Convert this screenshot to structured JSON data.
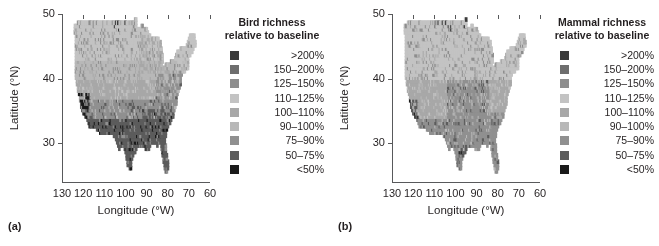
{
  "figure": {
    "background": "#ffffff",
    "axis_color": "#58595b",
    "text_color": "#231f20"
  },
  "chart_data": {
    "type": "heatmap",
    "title": "",
    "xlabel": "Longitude (°W)",
    "ylabel": "Latitude (°N)",
    "xlim": [
      130,
      60
    ],
    "ylim": [
      24,
      50
    ],
    "xticks": [
      130,
      120,
      110,
      100,
      90,
      80,
      70,
      60
    ],
    "yticks": [
      50,
      40,
      30
    ],
    "grid": false,
    "legend_position": "right",
    "cell_size_deg": 0.5,
    "classes": [
      {
        "label": ">200%",
        "color": "#3b3b3b",
        "min": 200,
        "max": null
      },
      {
        "label": "150–200%",
        "color": "#6e6e6e",
        "min": 150,
        "max": 200
      },
      {
        "label": "125–150%",
        "color": "#8e8e8e",
        "min": 125,
        "max": 150
      },
      {
        "label": "110–125%",
        "color": "#c3c3c3",
        "min": 110,
        "max": 125
      },
      {
        "label": "100–110%",
        "color": "#a8a8a8",
        "min": 100,
        "max": 110
      },
      {
        "label": "90–100%",
        "color": "#b8b8b8",
        "min": 90,
        "max": 100
      },
      {
        "label": "75–90%",
        "color": "#909090",
        "min": 75,
        "max": 90
      },
      {
        "label": "50–75%",
        "color": "#5c5c5c",
        "min": 50,
        "max": 75
      },
      {
        "label": "<50%",
        "color": "#1a1a1a",
        "min": null,
        "max": 50
      }
    ],
    "panels": [
      {
        "tag": "(a)",
        "legend_title_line1": "Bird richness",
        "legend_title_line2": "relative to baseline",
        "taxon": "bird",
        "field": {
          "description": "Richness class index by latitude band; north lighter (higher %), south darker (lower %).",
          "lat_bands": [
            {
              "lat_min": 46.0,
              "lat_max": 50.0,
              "class": 3
            },
            {
              "lat_min": 43.0,
              "lat_max": 46.0,
              "class": 3
            },
            {
              "lat_min": 40.0,
              "lat_max": 43.0,
              "class": 5
            },
            {
              "lat_min": 37.0,
              "lat_max": 40.0,
              "class": 4
            },
            {
              "lat_min": 34.0,
              "lat_max": 37.0,
              "class": 6
            },
            {
              "lat_min": 30.0,
              "lat_max": 34.0,
              "class": 7
            },
            {
              "lat_min": 24.0,
              "lat_max": 30.0,
              "class": 7
            }
          ],
          "hotspots": [
            {
              "name": "california-coast-low",
              "lon_min": 124.0,
              "lon_max": 117.0,
              "lat_min": 32.0,
              "lat_max": 38.0,
              "class": 8,
              "density": 0.55
            },
            {
              "name": "sierra-edge-low",
              "lon_min": 122.0,
              "lon_max": 118.0,
              "lat_min": 33.0,
              "lat_max": 36.5,
              "class": 7,
              "density": 0.5
            },
            {
              "name": "northern-plains-dark-specks",
              "lon_min": 106.0,
              "lon_max": 96.0,
              "lat_min": 47.5,
              "lat_max": 49.5,
              "class": 0,
              "density": 0.05
            },
            {
              "name": "gulf-coast-low",
              "lon_min": 98.0,
              "lon_max": 81.0,
              "lat_min": 25.0,
              "lat_max": 31.5,
              "class": 7,
              "density": 0.85
            },
            {
              "name": "southeast-low",
              "lon_min": 92.0,
              "lon_max": 76.0,
              "lat_min": 29.0,
              "lat_max": 35.5,
              "class": 7,
              "density": 0.7
            },
            {
              "name": "appalachian-mid",
              "lon_min": 86.0,
              "lon_max": 74.0,
              "lat_min": 35.0,
              "lat_max": 41.0,
              "class": 6,
              "density": 0.6
            },
            {
              "name": "northeast-light",
              "lon_min": 76.0,
              "lon_max": 67.0,
              "lat_min": 41.0,
              "lat_max": 47.5,
              "class": 3,
              "density": 0.8
            },
            {
              "name": "great-lakes-mid",
              "lon_min": 95.0,
              "lon_max": 80.0,
              "lat_min": 41.0,
              "lat_max": 47.0,
              "class": 4,
              "density": 0.5
            }
          ],
          "noise": 0.22
        }
      },
      {
        "tag": "(b)",
        "legend_title_line1": "Mammal richness",
        "legend_title_line2": "relative to baseline",
        "taxon": "mammal",
        "field": {
          "description": "Mammal pattern is lighter overall; most of country near baseline.",
          "lat_bands": [
            {
              "lat_min": 46.0,
              "lat_max": 50.0,
              "class": 3
            },
            {
              "lat_min": 43.0,
              "lat_max": 46.0,
              "class": 3
            },
            {
              "lat_min": 40.0,
              "lat_max": 43.0,
              "class": 3
            },
            {
              "lat_min": 37.0,
              "lat_max": 40.0,
              "class": 4
            },
            {
              "lat_min": 34.0,
              "lat_max": 37.0,
              "class": 4
            },
            {
              "lat_min": 30.0,
              "lat_max": 34.0,
              "class": 6
            },
            {
              "lat_min": 24.0,
              "lat_max": 30.0,
              "class": 6
            }
          ],
          "hotspots": [
            {
              "name": "california-coast-low",
              "lon_min": 124.0,
              "lon_max": 118.0,
              "lat_min": 32.5,
              "lat_max": 37.0,
              "class": 7,
              "density": 0.55
            },
            {
              "name": "socal-darkest",
              "lon_min": 121.0,
              "lon_max": 117.5,
              "lat_min": 32.5,
              "lat_max": 35.0,
              "class": 8,
              "density": 0.25
            },
            {
              "name": "northern-tier-specks",
              "lon_min": 112.0,
              "lon_max": 95.0,
              "lat_min": 47.5,
              "lat_max": 49.5,
              "class": 0,
              "density": 0.06
            },
            {
              "name": "central-plains-mid",
              "lon_min": 104.0,
              "lon_max": 84.0,
              "lat_min": 28.0,
              "lat_max": 40.0,
              "class": 6,
              "density": 0.8
            },
            {
              "name": "texas-gulf-dark",
              "lon_min": 99.0,
              "lon_max": 93.0,
              "lat_min": 25.5,
              "lat_max": 30.0,
              "class": 7,
              "density": 0.45
            },
            {
              "name": "northeast-light",
              "lon_min": 78.0,
              "lon_max": 67.0,
              "lat_min": 40.0,
              "lat_max": 47.5,
              "class": 3,
              "density": 0.85
            },
            {
              "name": "southeast-mid",
              "lon_min": 90.0,
              "lon_max": 76.0,
              "lat_min": 29.0,
              "lat_max": 35.0,
              "class": 6,
              "density": 0.6
            }
          ],
          "noise": 0.2
        }
      }
    ]
  }
}
